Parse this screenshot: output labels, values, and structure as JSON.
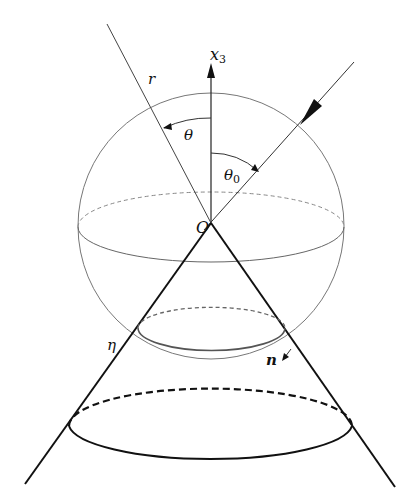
{
  "diagram": {
    "type": "geometry",
    "labels": {
      "axis": "x",
      "axis_sub": "3",
      "radius": "r",
      "theta": "θ",
      "theta0": "θ",
      "theta0_sub": "0",
      "origin": "O",
      "eta": "η",
      "normal": "n"
    },
    "colors": {
      "thin_line": "#555555",
      "thick_line": "#111111",
      "background": "#ffffff"
    }
  }
}
